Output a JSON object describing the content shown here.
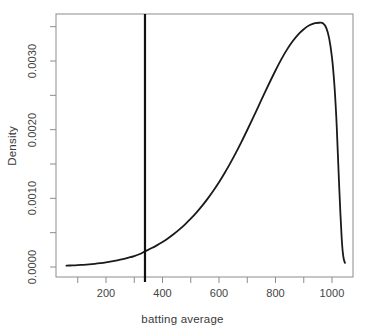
{
  "chart_data": {
    "type": "line",
    "title": "",
    "xlabel": "batting average",
    "ylabel": "Density",
    "xlim": [
      55,
      1060
    ],
    "ylim": [
      -0.00012,
      0.00382
    ],
    "grid": false,
    "legend": "none",
    "x_ticks": [
      {
        "value": 200,
        "label": "200"
      },
      {
        "value": 400,
        "label": "400"
      },
      {
        "value": 600,
        "label": "600"
      },
      {
        "value": 800,
        "label": "800"
      },
      {
        "value": 1000,
        "label": "1000"
      }
    ],
    "x_minor_ticks": [
      100,
      300,
      500,
      700,
      900
    ],
    "y_ticks": [
      {
        "value": 0.0,
        "label": "0.0000"
      },
      {
        "value": 0.001,
        "label": "0.0010"
      },
      {
        "value": 0.002,
        "label": "0.0020"
      },
      {
        "value": 0.003,
        "label": "0.0030"
      }
    ],
    "y_minor_ticks": [
      0.0005,
      0.0015,
      0.0025,
      0.0035
    ],
    "series": [
      {
        "name": "density",
        "color": "#1a1a1a",
        "line_width": 1.8,
        "points": [
          [
            60,
            2e-05
          ],
          [
            80,
            2.3e-05
          ],
          [
            100,
            2.7e-05
          ],
          [
            120,
            3.2e-05
          ],
          [
            140,
            3.8e-05
          ],
          [
            160,
            4.6e-05
          ],
          [
            180,
            5.6e-05
          ],
          [
            200,
            6.8e-05
          ],
          [
            220,
            8.2e-05
          ],
          [
            240,
            9.8e-05
          ],
          [
            260,
            0.000116
          ],
          [
            280,
            0.000136
          ],
          [
            300,
            0.000159
          ],
          [
            320,
            0.00019
          ],
          [
            338,
            0.000228
          ],
          [
            360,
            0.000272
          ],
          [
            380,
            0.000315
          ],
          [
            400,
            0.000363
          ],
          [
            420,
            0.000418
          ],
          [
            440,
            0.00048
          ],
          [
            460,
            0.000548
          ],
          [
            480,
            0.000622
          ],
          [
            500,
            0.000703
          ],
          [
            520,
            0.000792
          ],
          [
            540,
            0.00089
          ],
          [
            560,
            0.000996
          ],
          [
            580,
            0.00111
          ],
          [
            600,
            0.001234
          ],
          [
            620,
            0.001368
          ],
          [
            640,
            0.001512
          ],
          [
            660,
            0.001665
          ],
          [
            680,
            0.001826
          ],
          [
            700,
            0.001995
          ],
          [
            720,
            0.002168
          ],
          [
            740,
            0.002344
          ],
          [
            760,
            0.00252
          ],
          [
            780,
            0.002694
          ],
          [
            800,
            0.002862
          ],
          [
            820,
            0.00302
          ],
          [
            840,
            0.003162
          ],
          [
            860,
            0.003284
          ],
          [
            880,
            0.003385
          ],
          [
            900,
            0.003463
          ],
          [
            920,
            0.00352
          ],
          [
            940,
            0.003551
          ],
          [
            955,
            0.003557
          ],
          [
            968,
            0.00355
          ],
          [
            980,
            0.00348
          ],
          [
            990,
            0.00333
          ],
          [
            1000,
            0.00305
          ],
          [
            1008,
            0.00268
          ],
          [
            1015,
            0.0022
          ],
          [
            1020,
            0.00172
          ],
          [
            1025,
            0.00122
          ],
          [
            1030,
            0.00076
          ],
          [
            1034,
            0.00044
          ],
          [
            1038,
            0.00022
          ],
          [
            1042,
            0.00011
          ],
          [
            1046,
            6e-05
          ]
        ]
      }
    ],
    "annotations": [
      {
        "name": "vertical-reference-line",
        "type": "vline",
        "x": 338,
        "color": "#111111",
        "line_width": 2.2
      }
    ]
  },
  "axis_styling": {
    "box_color": "#8c8c8c",
    "tick_color": "#8c8c8c"
  }
}
